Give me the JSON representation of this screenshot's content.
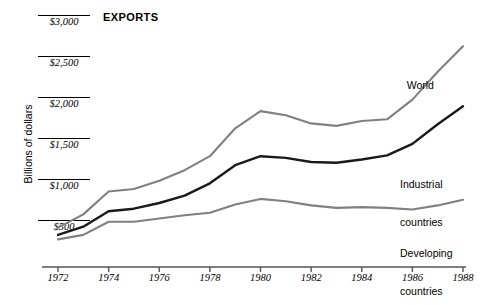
{
  "chart_data": {
    "type": "line",
    "title": "EXPORTS",
    "xlabel": "",
    "ylabel": "Billions of dollars",
    "x": [
      1972,
      1973,
      1974,
      1975,
      1976,
      1977,
      1978,
      1979,
      1980,
      1981,
      1982,
      1983,
      1984,
      1985,
      1986,
      1987,
      1988
    ],
    "xtick_labels": [
      "1972",
      "1974",
      "1976",
      "1978",
      "1980",
      "1982",
      "1984",
      "1986",
      "1988"
    ],
    "xticks": [
      1972,
      1974,
      1976,
      1978,
      1980,
      1982,
      1984,
      1986,
      1988
    ],
    "xlim": [
      1972,
      1988
    ],
    "ytick_labels": [
      "$500",
      "$1,000",
      "$1,500",
      "$2,000",
      "$2,500",
      "$3,000"
    ],
    "yticks": [
      500,
      1000,
      1500,
      2000,
      2500,
      3000
    ],
    "ylim": [
      275,
      3050
    ],
    "grid": false,
    "legend_position": "inline-annotations",
    "series": [
      {
        "name": "World",
        "color": "#808080",
        "values": [
          420,
          580,
          860,
          890,
          990,
          1120,
          1290,
          1630,
          1840,
          1790,
          1690,
          1660,
          1720,
          1740,
          1980,
          2320,
          2630
        ]
      },
      {
        "name": "Industrial countries",
        "color": "#1a1a1a",
        "values": [
          330,
          430,
          620,
          650,
          720,
          810,
          960,
          1180,
          1290,
          1270,
          1220,
          1210,
          1250,
          1300,
          1440,
          1680,
          1900
        ]
      },
      {
        "name": "Developing countries",
        "color": "#808080",
        "values": [
          275,
          330,
          490,
          490,
          530,
          570,
          600,
          700,
          770,
          740,
          690,
          660,
          670,
          660,
          640,
          690,
          760
        ]
      }
    ],
    "annotations": [
      {
        "text": "World",
        "series": "World"
      },
      {
        "text": "Industrial\ncountries",
        "series": "Industrial countries"
      },
      {
        "text": "Developing\ncountries",
        "series": "Developing countries"
      }
    ]
  },
  "labels": {
    "title": "EXPORTS",
    "y_axis_title": "Billions of dollars",
    "world": "World",
    "industrial_line1": "Industrial",
    "industrial_line2": "countries",
    "developing_line1": "Developing",
    "developing_line2": "countries"
  },
  "colors": {
    "axis": "#555555",
    "world_line": "#808080",
    "industrial_line": "#1a1a1a",
    "developing_line": "#808080",
    "text": "#000000",
    "background": "#ffffff"
  }
}
